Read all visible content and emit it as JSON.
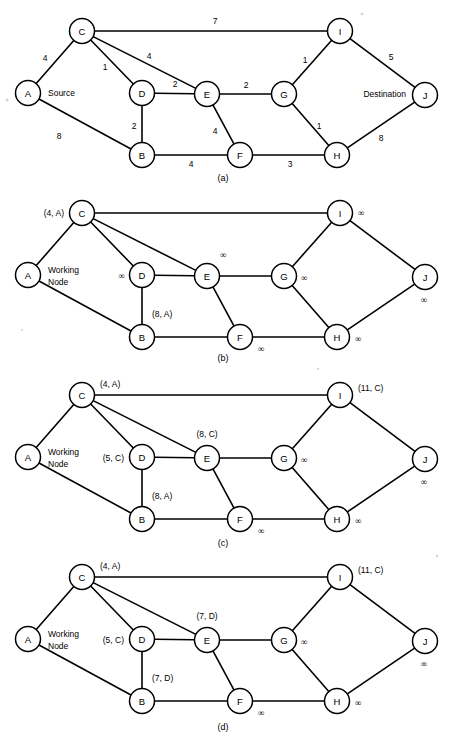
{
  "figure": {
    "width": 449,
    "height": 745,
    "ink_color": "#000000",
    "background_color": "#ffffff"
  },
  "node_ids": [
    "A",
    "B",
    "C",
    "D",
    "E",
    "F",
    "G",
    "H",
    "I",
    "J"
  ],
  "layout": {
    "nodes": {
      "A": {
        "x": 28,
        "y": 93
      },
      "C": {
        "x": 82,
        "y": 31
      },
      "D": {
        "x": 142,
        "y": 93
      },
      "B": {
        "x": 142,
        "y": 155
      },
      "E": {
        "x": 207,
        "y": 94
      },
      "F": {
        "x": 240,
        "y": 155
      },
      "G": {
        "x": 284,
        "y": 94
      },
      "H": {
        "x": 337,
        "y": 155
      },
      "I": {
        "x": 340,
        "y": 31
      },
      "J": {
        "x": 425,
        "y": 95
      }
    },
    "radius": 12.5,
    "edges": [
      {
        "from": "A",
        "to": "C"
      },
      {
        "from": "A",
        "to": "B"
      },
      {
        "from": "C",
        "to": "I"
      },
      {
        "from": "C",
        "to": "D"
      },
      {
        "from": "C",
        "to": "E"
      },
      {
        "from": "D",
        "to": "E"
      },
      {
        "from": "D",
        "to": "B"
      },
      {
        "from": "E",
        "to": "G"
      },
      {
        "from": "E",
        "to": "F"
      },
      {
        "from": "B",
        "to": "F"
      },
      {
        "from": "F",
        "to": "H"
      },
      {
        "from": "G",
        "to": "I"
      },
      {
        "from": "G",
        "to": "H"
      },
      {
        "from": "I",
        "to": "J"
      },
      {
        "from": "H",
        "to": "J"
      }
    ]
  },
  "panels": [
    {
      "key": "a",
      "caption": "(a)",
      "caption_x": 223,
      "caption_y": 178,
      "offset_y": 0,
      "annotations": [
        {
          "name": "weight-a-c",
          "text": "4",
          "x": 45,
          "y": 58,
          "anchor": "mid",
          "kind": "weight"
        },
        {
          "name": "weight-a-b",
          "text": "8",
          "x": 59,
          "y": 136,
          "anchor": "mid",
          "kind": "weight"
        },
        {
          "name": "weight-c-i",
          "text": "7",
          "x": 215,
          "y": 21,
          "anchor": "mid",
          "kind": "weight"
        },
        {
          "name": "weight-c-d",
          "text": "1",
          "x": 105,
          "y": 67,
          "anchor": "mid",
          "kind": "weight"
        },
        {
          "name": "weight-c-e",
          "text": "4",
          "x": 149,
          "y": 56,
          "anchor": "mid",
          "kind": "weight"
        },
        {
          "name": "weight-d-e",
          "text": "2",
          "x": 175,
          "y": 84,
          "anchor": "mid",
          "kind": "weight"
        },
        {
          "name": "weight-d-b",
          "text": "2",
          "x": 134,
          "y": 126,
          "anchor": "mid",
          "kind": "weight"
        },
        {
          "name": "weight-e-g",
          "text": "2",
          "x": 246,
          "y": 85,
          "anchor": "mid",
          "kind": "weight"
        },
        {
          "name": "weight-e-f",
          "text": "4",
          "x": 215,
          "y": 131,
          "anchor": "mid",
          "kind": "weight"
        },
        {
          "name": "weight-b-f",
          "text": "4",
          "x": 191,
          "y": 164,
          "anchor": "mid",
          "kind": "weight"
        },
        {
          "name": "weight-f-h",
          "text": "3",
          "x": 290,
          "y": 164,
          "anchor": "mid",
          "kind": "weight"
        },
        {
          "name": "weight-g-i",
          "text": "1",
          "x": 305,
          "y": 60,
          "anchor": "mid",
          "kind": "weight"
        },
        {
          "name": "weight-g-h",
          "text": "1",
          "x": 319,
          "y": 126,
          "anchor": "mid",
          "kind": "weight"
        },
        {
          "name": "weight-i-j",
          "text": "5",
          "x": 391,
          "y": 57,
          "anchor": "mid",
          "kind": "weight"
        },
        {
          "name": "weight-h-j",
          "text": "8",
          "x": 381,
          "y": 138,
          "anchor": "mid",
          "kind": "weight"
        },
        {
          "name": "source-label",
          "text": "Source",
          "x": 48,
          "y": 93,
          "anchor": "start",
          "kind": "text"
        },
        {
          "name": "destination-label",
          "text": "Destination",
          "x": 406,
          "y": 94,
          "anchor": "end",
          "kind": "text"
        }
      ]
    },
    {
      "key": "b",
      "caption": "(b)",
      "caption_x": 223,
      "caption_y": 358,
      "offset_y": 182,
      "annotations": [
        {
          "name": "label-c",
          "text": "(4, A)",
          "x": 64,
          "y": 31,
          "anchor": "end",
          "kind": "text"
        },
        {
          "name": "working-node-line1",
          "text": "Working",
          "x": 48,
          "y": 88,
          "anchor": "start",
          "kind": "text"
        },
        {
          "name": "working-node-line2",
          "text": "Node",
          "x": 48,
          "y": 100,
          "anchor": "start",
          "kind": "text"
        },
        {
          "name": "label-d",
          "text": "∞",
          "x": 125,
          "y": 94,
          "anchor": "end",
          "kind": "inf"
        },
        {
          "name": "label-b",
          "text": "(8, A)",
          "x": 152,
          "y": 132,
          "anchor": "start",
          "kind": "text"
        },
        {
          "name": "label-e",
          "text": "∞",
          "x": 220,
          "y": 73,
          "anchor": "start",
          "kind": "inf"
        },
        {
          "name": "label-f",
          "text": "∞",
          "x": 258,
          "y": 167,
          "anchor": "start",
          "kind": "inf"
        },
        {
          "name": "label-g",
          "text": "∞",
          "x": 301,
          "y": 96,
          "anchor": "start",
          "kind": "inf"
        },
        {
          "name": "label-h",
          "text": "∞",
          "x": 355,
          "y": 157,
          "anchor": "start",
          "kind": "inf"
        },
        {
          "name": "label-i",
          "text": "∞",
          "x": 358,
          "y": 31,
          "anchor": "start",
          "kind": "inf"
        },
        {
          "name": "label-j",
          "text": "∞",
          "x": 424,
          "y": 118,
          "anchor": "mid",
          "kind": "inf"
        }
      ]
    },
    {
      "key": "c",
      "caption": "(c)",
      "caption_x": 223,
      "caption_y": 543,
      "offset_y": 364,
      "annotations": [
        {
          "name": "label-c",
          "text": "(4, A)",
          "x": 100,
          "y": 20,
          "anchor": "start",
          "kind": "text"
        },
        {
          "name": "working-node-line1",
          "text": "Working",
          "x": 48,
          "y": 88,
          "anchor": "start",
          "kind": "text"
        },
        {
          "name": "working-node-line2",
          "text": "Node",
          "x": 48,
          "y": 100,
          "anchor": "start",
          "kind": "text"
        },
        {
          "name": "label-d",
          "text": "(5, C)",
          "x": 124,
          "y": 94,
          "anchor": "end",
          "kind": "text"
        },
        {
          "name": "label-b",
          "text": "(8, A)",
          "x": 152,
          "y": 132,
          "anchor": "start",
          "kind": "text"
        },
        {
          "name": "label-e",
          "text": "(8, C)",
          "x": 207,
          "y": 70,
          "anchor": "mid",
          "kind": "text"
        },
        {
          "name": "label-f",
          "text": "∞",
          "x": 258,
          "y": 167,
          "anchor": "start",
          "kind": "inf"
        },
        {
          "name": "label-g",
          "text": "∞",
          "x": 301,
          "y": 96,
          "anchor": "start",
          "kind": "inf"
        },
        {
          "name": "label-h",
          "text": "∞",
          "x": 355,
          "y": 157,
          "anchor": "start",
          "kind": "inf"
        },
        {
          "name": "label-i",
          "text": "(11, C)",
          "x": 358,
          "y": 24,
          "anchor": "start",
          "kind": "text"
        },
        {
          "name": "label-j",
          "text": "∞",
          "x": 424,
          "y": 118,
          "anchor": "mid",
          "kind": "inf"
        }
      ]
    },
    {
      "key": "d",
      "caption": "(d)",
      "caption_x": 223,
      "caption_y": 727,
      "offset_y": 546,
      "annotations": [
        {
          "name": "label-c",
          "text": "(4, A)",
          "x": 100,
          "y": 20,
          "anchor": "start",
          "kind": "text"
        },
        {
          "name": "working-node-line1",
          "text": "Working",
          "x": 48,
          "y": 88,
          "anchor": "start",
          "kind": "text"
        },
        {
          "name": "working-node-line2",
          "text": "Node",
          "x": 48,
          "y": 100,
          "anchor": "start",
          "kind": "text"
        },
        {
          "name": "label-d",
          "text": "(5, C)",
          "x": 124,
          "y": 94,
          "anchor": "end",
          "kind": "text"
        },
        {
          "name": "label-b",
          "text": "(7, D)",
          "x": 152,
          "y": 132,
          "anchor": "start",
          "kind": "text"
        },
        {
          "name": "label-e",
          "text": "(7, D)",
          "x": 207,
          "y": 70,
          "anchor": "mid",
          "kind": "text"
        },
        {
          "name": "label-f",
          "text": "∞",
          "x": 258,
          "y": 167,
          "anchor": "start",
          "kind": "inf"
        },
        {
          "name": "label-g",
          "text": "∞",
          "x": 301,
          "y": 96,
          "anchor": "start",
          "kind": "inf"
        },
        {
          "name": "label-h",
          "text": "∞",
          "x": 355,
          "y": 157,
          "anchor": "start",
          "kind": "inf"
        },
        {
          "name": "label-i",
          "text": "(11, C)",
          "x": 358,
          "y": 24,
          "anchor": "start",
          "kind": "text"
        },
        {
          "name": "label-j",
          "text": "∞",
          "x": 424,
          "y": 118,
          "anchor": "mid",
          "kind": "inf"
        }
      ]
    }
  ],
  "graph_data": {
    "type": "diagram",
    "graph_kind": "undirected-weighted",
    "source": "A",
    "destination": "J",
    "nodes": [
      "A",
      "B",
      "C",
      "D",
      "E",
      "F",
      "G",
      "H",
      "I",
      "J"
    ],
    "edges": [
      {
        "u": "A",
        "v": "C",
        "w": 4
      },
      {
        "u": "A",
        "v": "B",
        "w": 8
      },
      {
        "u": "C",
        "v": "I",
        "w": 7
      },
      {
        "u": "C",
        "v": "D",
        "w": 1
      },
      {
        "u": "C",
        "v": "E",
        "w": 4
      },
      {
        "u": "D",
        "v": "E",
        "w": 2
      },
      {
        "u": "D",
        "v": "B",
        "w": 2
      },
      {
        "u": "E",
        "v": "G",
        "w": 2
      },
      {
        "u": "E",
        "v": "F",
        "w": 4
      },
      {
        "u": "B",
        "v": "F",
        "w": 4
      },
      {
        "u": "F",
        "v": "H",
        "w": 3
      },
      {
        "u": "G",
        "v": "I",
        "w": 1
      },
      {
        "u": "G",
        "v": "H",
        "w": 1
      },
      {
        "u": "I",
        "v": "J",
        "w": 5
      },
      {
        "u": "H",
        "v": "J",
        "w": 8
      }
    ],
    "steps": [
      {
        "panel": "a",
        "caption": "(a)",
        "description": "Original weighted graph with Source A and Destination J",
        "labels": {}
      },
      {
        "panel": "b",
        "caption": "(b)",
        "working_node": "A",
        "labels": {
          "C": "(4, A)",
          "B": "(8, A)",
          "D": "∞",
          "E": "∞",
          "F": "∞",
          "G": "∞",
          "H": "∞",
          "I": "∞",
          "J": "∞"
        }
      },
      {
        "panel": "c",
        "caption": "(c)",
        "working_node": "C",
        "labels": {
          "C": "(4, A)",
          "D": "(5, C)",
          "B": "(8, A)",
          "E": "(8, C)",
          "I": "(11, C)",
          "F": "∞",
          "G": "∞",
          "H": "∞",
          "J": "∞"
        }
      },
      {
        "panel": "d",
        "caption": "(d)",
        "working_node": "D",
        "labels": {
          "C": "(4, A)",
          "D": "(5, C)",
          "B": "(7, D)",
          "E": "(7, D)",
          "I": "(11, C)",
          "F": "∞",
          "G": "∞",
          "H": "∞",
          "J": "∞"
        }
      }
    ]
  }
}
